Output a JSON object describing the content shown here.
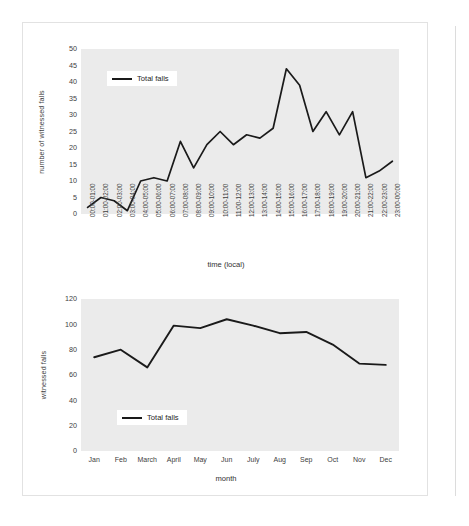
{
  "page": {
    "background_color": "#ffffff",
    "sheet_border_color": "#e2e2e2",
    "gutter_line_color": "#dcdcdc"
  },
  "style": {
    "plot_background": "#ebebeb",
    "line_color": "#1a1a1a",
    "tick_color": "#404040"
  },
  "chart_data": [
    {
      "id": "falls-by-hour",
      "type": "line",
      "title": "",
      "xlabel": "time (local)",
      "ylabel": "number of witnessed falls",
      "ylim": [
        0,
        50
      ],
      "yticks": [
        0,
        5,
        10,
        15,
        20,
        25,
        30,
        35,
        40,
        45,
        50
      ],
      "grid": false,
      "legend": [
        "Total falls"
      ],
      "legend_position": "upper-left-inside",
      "categories": [
        "00:00-01:00",
        "01:00-02:00",
        "02:00-03:00",
        "03:00-04:00",
        "04:00-05:00",
        "05:00-06:00",
        "06:00-07:00",
        "07:00-08:00",
        "08:00-09:00",
        "09:00-10:00",
        "10:00-11:00",
        "11:00-12:00",
        "12:00-13:00",
        "13:00-14:00",
        "14:00-15:00",
        "15:00-16:00",
        "16:00-17:00",
        "17:00-18:00",
        "18:00-19:00",
        "19:00-20:00",
        "20:00-21:00",
        "21:00-22:00",
        "22:00-23:00",
        "23:00-00:00"
      ],
      "series": [
        {
          "name": "Total falls",
          "values": [
            2,
            5,
            4,
            1,
            10,
            11,
            10,
            22,
            14,
            21,
            25,
            21,
            24,
            23,
            26,
            44,
            39,
            25,
            31,
            24,
            31,
            11,
            13,
            16
          ]
        }
      ]
    },
    {
      "id": "falls-by-month",
      "type": "line",
      "title": "",
      "xlabel": "month",
      "ylabel": "witnessed falls",
      "ylim": [
        0,
        120
      ],
      "yticks": [
        0,
        20,
        40,
        60,
        80,
        100,
        120
      ],
      "grid": false,
      "legend": [
        "Total falls"
      ],
      "legend_position": "lower-left-inside",
      "categories": [
        "Jan",
        "Feb",
        "March",
        "April",
        "May",
        "Jun",
        "July",
        "Aug",
        "Sep",
        "Oct",
        "Nov",
        "Dec"
      ],
      "series": [
        {
          "name": "Total falls",
          "values": [
            74,
            80,
            66,
            99,
            97,
            104,
            99,
            93,
            94,
            84,
            69,
            68
          ]
        }
      ]
    }
  ]
}
